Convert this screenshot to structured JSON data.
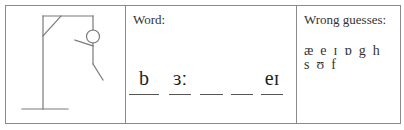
{
  "gallows": {
    "stroke_color": "#7a7a7a",
    "parts_shown": [
      "base",
      "pole",
      "beam",
      "brace",
      "rope",
      "head",
      "body",
      "arm",
      "leg"
    ]
  },
  "word_panel": {
    "label": "Word:",
    "slots": [
      {
        "value": "b"
      },
      {
        "value": "ɜː"
      },
      {
        "value": ""
      },
      {
        "value": ""
      },
      {
        "value": "eɪ"
      }
    ]
  },
  "wrong_panel": {
    "label": "Wrong guesses:",
    "rows": [
      [
        "æ",
        "e",
        "ɪ",
        "ɒ",
        "g",
        "h"
      ],
      [
        "s",
        "ʊ",
        "f"
      ]
    ]
  }
}
